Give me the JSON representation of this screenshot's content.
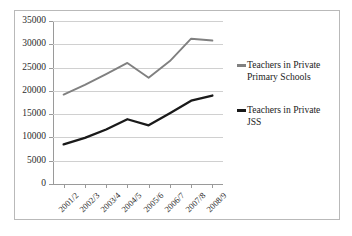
{
  "chart_data": {
    "type": "line",
    "title": "",
    "xlabel": "",
    "ylabel": "",
    "categories": [
      "2001/2",
      "2002/3",
      "2003/4",
      "2004/5",
      "2005/6",
      "2006/7",
      "2007/8",
      "2008/9"
    ],
    "series": [
      {
        "name": "Teachers in Private Primary Schools",
        "color": "#808080",
        "values": [
          19200,
          21300,
          23600,
          26000,
          22800,
          26400,
          31200,
          30800
        ]
      },
      {
        "name": "Teachers in Private JSS",
        "color": "#1a1a1a",
        "values": [
          8500,
          9900,
          11700,
          13900,
          12600,
          15200,
          17900,
          19000
        ]
      }
    ],
    "ylim": [
      0,
      35000
    ],
    "yticks": [
      0,
      5000,
      10000,
      15000,
      20000,
      25000,
      30000,
      35000
    ],
    "ytick_labels": [
      "0",
      "5000",
      "10000",
      "15000",
      "20000",
      "25000",
      "30000",
      "35000"
    ],
    "grid": true,
    "legend_position": "right",
    "xtick_rotation": -45
  },
  "legend": {
    "entries": [
      {
        "label": "Teachers in Private\nPrimary Schools",
        "color": "#808080"
      },
      {
        "label": "Teachers in Private\nJSS",
        "color": "#1a1a1a"
      }
    ]
  }
}
